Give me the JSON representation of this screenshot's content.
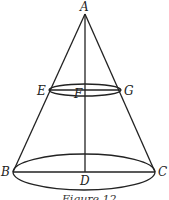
{
  "figure": {
    "caption": "Figure 12",
    "labels": {
      "A": "A",
      "E": "E",
      "F": "F",
      "G": "G",
      "B": "B",
      "C": "C",
      "D": "D"
    },
    "points": {
      "A": [
        85,
        14
      ],
      "E": [
        49,
        90
      ],
      "F": [
        85,
        90
      ],
      "G": [
        121,
        90
      ],
      "B": [
        13,
        172
      ],
      "D": [
        85,
        172
      ],
      "C": [
        155,
        172
      ]
    },
    "stroke_color": "#222222"
  }
}
